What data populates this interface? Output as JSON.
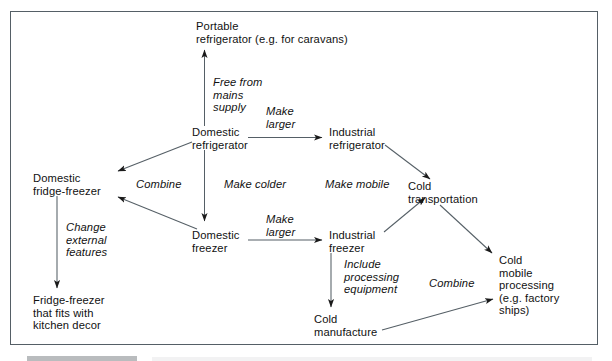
{
  "figure": {
    "type": "flow-diagram",
    "frame": {
      "border_color": "#555f66",
      "background": "#ffffff"
    }
  },
  "nodes": [
    {
      "id": "portable_refrigerator",
      "label": "Portable\nrefrigerator (e.g. for caravans)"
    },
    {
      "id": "domestic_refrigerator",
      "label": "Domestic\nrefrigerator"
    },
    {
      "id": "industrial_refrigerator",
      "label": "Industrial\nrefrigerator"
    },
    {
      "id": "domestic_fridge_freezer",
      "label": "Domestic\nfridge-freezer"
    },
    {
      "id": "cold_transportation",
      "label": "Cold\ntransportation"
    },
    {
      "id": "domestic_freezer",
      "label": "Domestic\nfreezer"
    },
    {
      "id": "industrial_freezer",
      "label": "Industrial\nfreezer"
    },
    {
      "id": "fridge_freezer_kitchen_decor",
      "label": "Fridge-freezer\nthat fits with\nkitchen decor"
    },
    {
      "id": "cold_manufacture",
      "label": "Cold\nmanufacture"
    },
    {
      "id": "cold_mobile_processing",
      "label": "Cold\nmobile\nprocessing\n(e.g. factory\nships)"
    }
  ],
  "edges": [
    {
      "id": "e1",
      "from": "domestic_refrigerator",
      "to": "portable_refrigerator",
      "label": "Free from\nmains\nsupply"
    },
    {
      "id": "e2",
      "from": "domestic_refrigerator",
      "to": "industrial_refrigerator",
      "label": "Make\nlarger"
    },
    {
      "id": "e3",
      "from": "domestic_refrigerator",
      "to": "domestic_fridge_freezer",
      "label": "Combine"
    },
    {
      "id": "e4",
      "from": "domestic_refrigerator",
      "to": "domestic_freezer",
      "label": "Make colder"
    },
    {
      "id": "e5",
      "from": "industrial_refrigerator",
      "to": "cold_transportation",
      "label": "Make mobile"
    },
    {
      "id": "e6",
      "from": "domestic_freezer",
      "to": "domestic_fridge_freezer",
      "label": ""
    },
    {
      "id": "e7",
      "from": "domestic_freezer",
      "to": "industrial_freezer",
      "label": "Make\nlarger"
    },
    {
      "id": "e8",
      "from": "domestic_fridge_freezer",
      "to": "fridge_freezer_kitchen_decor",
      "label": "Change\nexternal\nfeatures"
    },
    {
      "id": "e9",
      "from": "industrial_freezer",
      "to": "cold_transportation",
      "label": ""
    },
    {
      "id": "e10",
      "from": "industrial_freezer",
      "to": "cold_manufacture",
      "label": "Include\nprocessing\nequipment"
    },
    {
      "id": "e11",
      "from": "cold_transportation",
      "to": "cold_mobile_processing",
      "label": ""
    },
    {
      "id": "e12",
      "from": "cold_manufacture",
      "to": "cold_mobile_processing",
      "label": "Combine"
    }
  ],
  "labels": {
    "free_from_mains_supply": "Free from\nmains\nsupply",
    "make_larger_top": "Make\nlarger",
    "combine_left": "Combine",
    "make_colder": "Make colder",
    "make_mobile": "Make mobile",
    "make_larger_bottom": "Make\nlarger",
    "change_external_features": "Change\nexternal\nfeatures",
    "include_processing_equipment": "Include\nprocessing\nequipment",
    "combine_right": "Combine"
  }
}
